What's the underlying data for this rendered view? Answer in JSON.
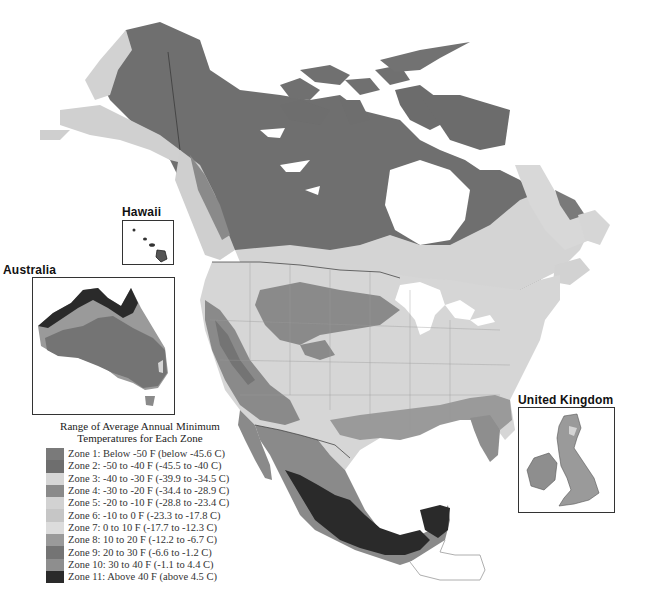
{
  "map": {
    "subject": "USDA plant hardiness zones of North America with insets",
    "insets": {
      "hawaii": {
        "label": "Hawaii"
      },
      "australia": {
        "label": "Australia"
      },
      "united_kingdom": {
        "label": "United Kingdom"
      }
    }
  },
  "legend": {
    "title_line1": "Range of Average Annual Minimum",
    "title_line2": "Temperatures for Each Zone",
    "zones": [
      {
        "label": "Zone 1:  Below -50 F (below -45.6 C)",
        "color": "#7a7a7a"
      },
      {
        "label": "Zone 2:  -50 to -40 F (-45.5 to -40 C)",
        "color": "#6e6e6e"
      },
      {
        "label": "Zone 3:  -40 to -30 F (-39.9 to -34.5 C)",
        "color": "#d6d6d6"
      },
      {
        "label": "Zone 4:  -30 to -20 F (-34.4 to -28.9 C)",
        "color": "#8a8a8a"
      },
      {
        "label": "Zone 5:  -20 to -10 F (-28.8 to -23.4 C)",
        "color": "#d2d2d2"
      },
      {
        "label": "Zone 6:  -10 to 0 F (-23.3 to -17.8 C)",
        "color": "#c6c6c6"
      },
      {
        "label": "Zone 7:  0 to 10 F (-17.7 to -12.3 C)",
        "color": "#dcdcdc"
      },
      {
        "label": "Zone 8:  10 to 20 F (-12.2 to -6.7 C)",
        "color": "#9a9a9a"
      },
      {
        "label": "Zone 9:  20 to 30 F (-6.6 to -1.2 C)",
        "color": "#747474"
      },
      {
        "label": "Zone 10:  30 to 40 F (-1.1 to 4.4 C)",
        "color": "#8e8e8e"
      },
      {
        "label": "Zone 11:  Above 40 F (above 4.5 C)",
        "color": "#2a2a2a"
      }
    ]
  }
}
